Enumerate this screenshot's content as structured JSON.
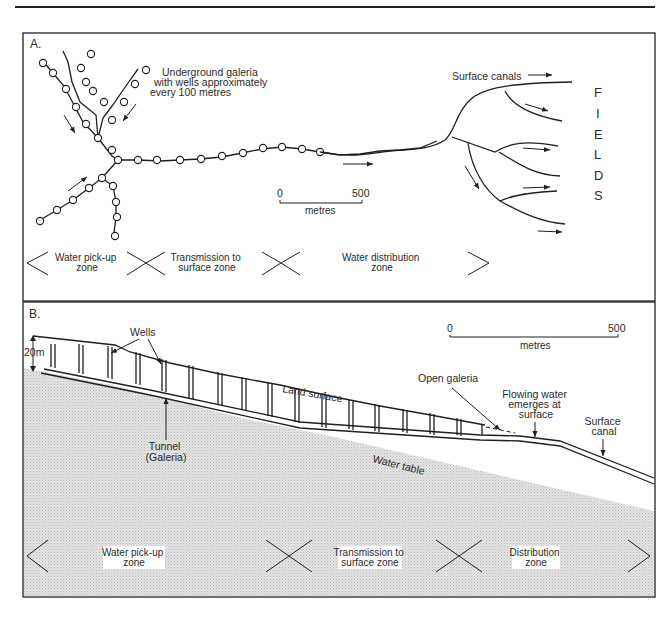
{
  "figure": {
    "panel_a": {
      "letter": "A.",
      "galeria_label": [
        "Underground galeria",
        "with wells approximately",
        "every 100 metres"
      ],
      "canals_label": "Surface canals",
      "fields_letters": [
        "F",
        "I",
        "E",
        "L",
        "D",
        "S"
      ],
      "scale": {
        "start": "0",
        "end": "500",
        "unit": "metres"
      },
      "zones": [
        {
          "line1": "Water pick-up",
          "line2": "zone"
        },
        {
          "line1": "Transmission to",
          "line2": "surface zone"
        },
        {
          "line1": "Water distribution",
          "line2": "zone"
        }
      ]
    },
    "panel_b": {
      "letter": "B.",
      "depth_label": "20m",
      "wells_label": "Wells",
      "land_surface_label": "Land surface",
      "tunnel_label": [
        "Tunnel",
        "(Galeria)"
      ],
      "open_galeria_label": "Open galeria",
      "flowing_label": [
        "Flowing water",
        "emerges at",
        "surface"
      ],
      "surface_canal_label": [
        "Surface",
        "canal"
      ],
      "water_table_label": "Water table",
      "scale": {
        "start": "0",
        "end": "500",
        "unit": "metres"
      },
      "zones": [
        {
          "line1": "Water pick-up",
          "line2": "zone"
        },
        {
          "line1": "Transmission to",
          "line2": "surface zone"
        },
        {
          "line1": "Distribution",
          "line2": "zone"
        }
      ]
    },
    "colors": {
      "line": "#1f1f1f",
      "ground_fill": "#d9d9d9",
      "background": "#ffffff"
    }
  }
}
